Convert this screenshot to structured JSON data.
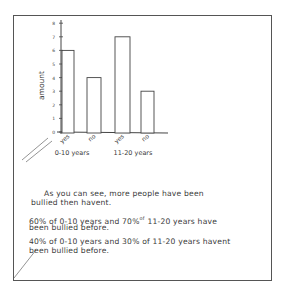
{
  "chart_data": {
    "type": "bar",
    "title": "",
    "xlabel": "",
    "ylabel": "amount",
    "ylim": [
      0,
      8
    ],
    "yticks": [
      0,
      1,
      2,
      3,
      4,
      5,
      6,
      7,
      8
    ],
    "grid": false,
    "legend": "none",
    "categories": [
      "yes",
      "no",
      "yes",
      "no"
    ],
    "groups": [
      {
        "label": "0-10 years",
        "categories": [
          "yes",
          "no"
        ]
      },
      {
        "label": "11-20 years",
        "categories": [
          "yes",
          "no"
        ]
      }
    ],
    "values": [
      6,
      4,
      7,
      3
    ]
  },
  "notes": {
    "line1": "As you can see, more people have been",
    "line2": "bullied then havent.",
    "line3a": "60% of 0-10 years and 70%",
    "line3sup": "of",
    "line3b": " 11-20 years have",
    "line4": "been bullied before.",
    "line5": "40% of 0-10 years and 30% of 11-20 years havent",
    "line6": "been bullied before."
  },
  "colors": {
    "ink": "#3a3a3a",
    "bar_fill": "#ffffff",
    "frame": "#555555"
  }
}
